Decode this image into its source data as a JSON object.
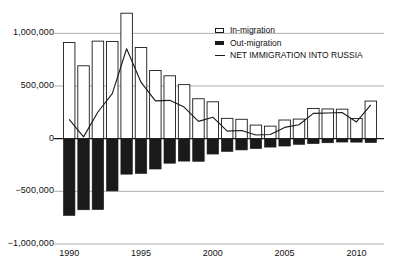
{
  "chart_data": {
    "type": "bar",
    "title": "",
    "subtitle": "",
    "xlabel": "",
    "ylabel": "",
    "grid": true,
    "legend_position": "top-right",
    "ylim": [
      -1000000,
      1250000
    ],
    "yticks": [
      1000000,
      500000,
      0,
      -500000,
      -1000000
    ],
    "ytick_labels": [
      "1,000,000",
      "500,000",
      "0",
      "−500,000",
      "−1,000,000"
    ],
    "xticks": [
      1990,
      1995,
      2000,
      2005,
      2010
    ],
    "xtick_labels": [
      "1990",
      "1995",
      "2000",
      "2005",
      "2010"
    ],
    "categories": [
      1990,
      1991,
      1992,
      1993,
      1994,
      1995,
      1996,
      1997,
      1998,
      1999,
      2000,
      2001,
      2002,
      2003,
      2004,
      2005,
      2006,
      2007,
      2008,
      2009,
      2010,
      2011
    ],
    "series": [
      {
        "name": "In-migration",
        "type": "bar",
        "style": "open",
        "fill": "#ffffff",
        "stroke": "#1a1a1a",
        "values": [
          913000,
          692000,
          926000,
          923000,
          1191000,
          866000,
          647000,
          597000,
          513000,
          379000,
          350000,
          193000,
          184000,
          129000,
          119000,
          177000,
          186000,
          287000,
          282000,
          280000,
          192000,
          357000
        ]
      },
      {
        "name": "Out-migration",
        "type": "bar",
        "style": "filled",
        "fill": "#1a1a1a",
        "stroke": "#1a1a1a",
        "values": [
          -729000,
          -675000,
          -673000,
          -496000,
          -337000,
          -330000,
          -288000,
          -233000,
          -213000,
          -215000,
          -146000,
          -121000,
          -107000,
          -94000,
          -80000,
          -70000,
          -54000,
          -47000,
          -39000,
          -32000,
          -33000,
          -37000
        ]
      },
      {
        "name": "NET IMMIGRATION INTO RUSSIA",
        "type": "line",
        "stroke": "#1a1a1a",
        "values": [
          184000,
          17000,
          253000,
          427000,
          854000,
          536000,
          359000,
          364000,
          300000,
          164000,
          204000,
          72000,
          77000,
          35000,
          39000,
          107000,
          132000,
          240000,
          243000,
          248000,
          159000,
          320000
        ]
      }
    ],
    "legend": [
      {
        "label": "In-migration",
        "marker": "open-rect"
      },
      {
        "label": "Out-migration",
        "marker": "filled-rect"
      },
      {
        "label": "NET IMMIGRATION INTO RUSSIA",
        "marker": "line"
      }
    ],
    "colors": {
      "ink": "#1a1a1a",
      "grid": "#9a9a9a",
      "background": "#ffffff"
    }
  }
}
